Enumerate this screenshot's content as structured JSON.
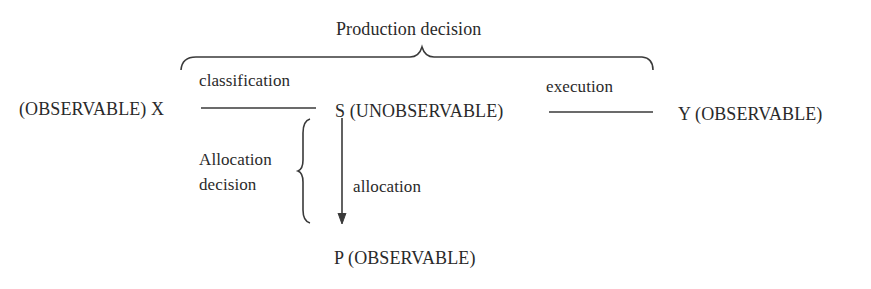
{
  "diagram": {
    "title": "Production decision",
    "nodes": {
      "x": "(OBSERVABLE) X",
      "s": "S (UNOBSERVABLE)",
      "y": "Y (OBSERVABLE)",
      "p": "P (OBSERVABLE)"
    },
    "edges": {
      "classification": "classification",
      "execution": "execution",
      "allocation": "allocation"
    },
    "allocation_decision": {
      "line1": "Allocation",
      "line2": "decision"
    }
  }
}
